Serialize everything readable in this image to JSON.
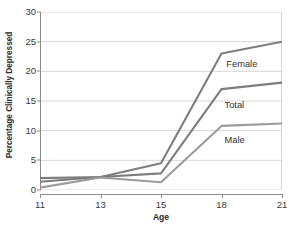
{
  "chart_data": {
    "type": "line",
    "title": "",
    "xlabel": "Age",
    "ylabel": "Percentage Clinically Depressed",
    "categories": [
      "11",
      "13",
      "15",
      "18",
      "21"
    ],
    "x_tick_labels": [
      "11",
      "13",
      "15",
      "18",
      "21"
    ],
    "y_tick_labels": [
      "0",
      "5",
      "10",
      "15",
      "20",
      "25",
      "30"
    ],
    "y_ticks": [
      0,
      5,
      10,
      15,
      20,
      25,
      30
    ],
    "ylim": [
      0,
      30
    ],
    "grid": "horizontal",
    "legend": "inline-labels",
    "series": [
      {
        "name": "Female",
        "color": "#7d7d7d",
        "values": [
          2.0,
          2.2,
          4.5,
          23.0,
          25.0
        ],
        "label_x": 3.08,
        "label_y": 21.0
      },
      {
        "name": "Total",
        "color": "#7d7d7d",
        "values": [
          1.4,
          2.2,
          2.8,
          17.0,
          18.1
        ],
        "label_x": 3.05,
        "label_y": 14.1
      },
      {
        "name": "Male",
        "color": "#9b9b9b",
        "values": [
          0.4,
          2.1,
          1.3,
          10.8,
          11.2
        ],
        "label_x": 3.05,
        "label_y": 8.2
      }
    ]
  },
  "colors": {
    "gridline": "#d6d6d6",
    "axis": "#8c8c8c",
    "text": "#333333"
  }
}
